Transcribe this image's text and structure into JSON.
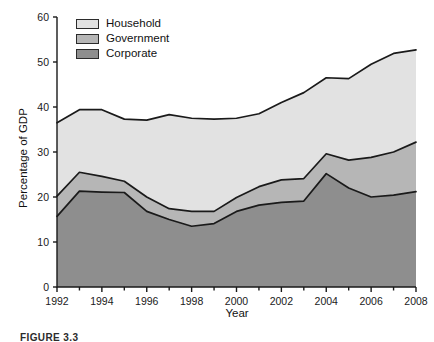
{
  "figure": {
    "caption": "FIGURE 3.3"
  },
  "legend": {
    "position": "top-left-inside",
    "items": [
      {
        "label": "Household",
        "color": "#e2e2e2",
        "key": "household"
      },
      {
        "label": "Government",
        "color": "#b6b6b6",
        "key": "government"
      },
      {
        "label": "Corporate",
        "color": "#8e8e8e",
        "key": "corporate"
      }
    ]
  },
  "axes": {
    "y": {
      "title": "Percentage of GDP",
      "ticks": [
        "0",
        "10",
        "20",
        "30",
        "40",
        "50",
        "60"
      ]
    },
    "x": {
      "title": "Year",
      "ticks": [
        "1992",
        "1994",
        "1996",
        "1998",
        "2000",
        "2002",
        "2004",
        "2006",
        "2008"
      ]
    }
  },
  "colors": {
    "household": "#e2e2e2",
    "government": "#b6b6b6",
    "corporate": "#8e8e8e",
    "line": "#1a1a1a",
    "axis": "#1a1a1a",
    "background": "#ffffff"
  },
  "chart_data": {
    "type": "area",
    "stacked": true,
    "title": "",
    "xlabel": "Year",
    "ylabel": "Percentage of GDP",
    "xlim": [
      1992,
      2008
    ],
    "ylim": [
      0,
      60
    ],
    "ytick_step": 10,
    "xtick_step_major": 2,
    "xtick_step_minor": 1,
    "grid": false,
    "legend_position": "top-left-inside",
    "x": [
      1992,
      1993,
      1994,
      1995,
      1996,
      1997,
      1998,
      1999,
      2000,
      2001,
      2002,
      2003,
      2004,
      2005,
      2006,
      2007,
      2008
    ],
    "series": [
      {
        "name": "Corporate",
        "color": "#8e8e8e",
        "values": [
          15.7,
          21.3,
          21.1,
          21.0,
          16.8,
          15.0,
          13.5,
          14.1,
          16.8,
          18.2,
          18.8,
          19.1,
          25.2,
          22.0,
          20.0,
          20.4,
          21.2
        ]
      },
      {
        "name": "Government",
        "color": "#b6b6b6",
        "values": [
          4.5,
          4.2,
          3.5,
          2.5,
          3.2,
          2.4,
          3.3,
          2.7,
          3.1,
          4.1,
          5.0,
          5.0,
          4.4,
          6.2,
          8.8,
          9.6,
          11.0
        ]
      },
      {
        "name": "Household",
        "color": "#e2e2e2",
        "values": [
          16.3,
          13.9,
          14.8,
          13.8,
          17.1,
          20.9,
          20.7,
          20.5,
          17.6,
          16.2,
          17.2,
          19.1,
          16.9,
          18.1,
          20.7,
          21.9,
          20.5
        ]
      }
    ],
    "cumulative_tops": {
      "corporate": [
        15.7,
        21.3,
        21.1,
        21.0,
        16.8,
        15.0,
        13.5,
        14.1,
        16.8,
        18.2,
        18.8,
        19.1,
        25.2,
        22.0,
        20.0,
        20.4,
        21.2
      ],
      "government": [
        20.2,
        25.5,
        24.6,
        23.5,
        20.0,
        17.4,
        16.8,
        16.8,
        19.9,
        22.3,
        23.8,
        24.1,
        29.6,
        28.2,
        28.8,
        30.0,
        32.2
      ],
      "household": [
        36.5,
        39.4,
        39.4,
        37.3,
        37.1,
        38.3,
        37.5,
        37.3,
        37.5,
        38.5,
        41.0,
        43.2,
        46.5,
        46.3,
        49.5,
        51.9,
        52.7
      ]
    }
  }
}
